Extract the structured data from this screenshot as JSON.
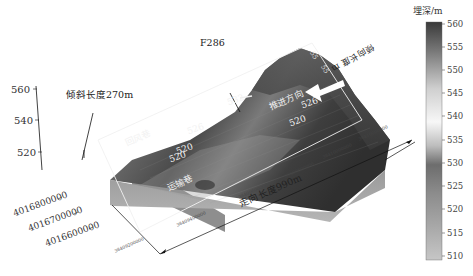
{
  "figure": {
    "type": "3d-terrain-surface",
    "annotations": {
      "fault": "F286",
      "dip_length": "倾斜长度270m",
      "strike_length": "走向长度990m",
      "advance_direction": "推进方向",
      "return_airway": "回风巷",
      "haulage_roadway": "运输巷",
      "rotated_label": "倾向长度 m"
    },
    "terrain_labels": [
      "532",
      "526",
      "526",
      "520",
      "520",
      "520",
      "55",
      "55"
    ],
    "z_axis": {
      "ticks": [
        "560",
        "540",
        "520"
      ]
    },
    "y_axis": {
      "ticks": [
        "4016800000",
        "4016700000",
        "4016600000"
      ]
    },
    "x_axis": {
      "ticks": [
        "38409200000",
        "38409400000",
        "38409600000",
        "38409800000",
        "38410000000",
        "38410000000"
      ]
    },
    "colorbar": {
      "title": "埋深/m",
      "ticks": [
        "560",
        "555",
        "550",
        "545",
        "540",
        "535",
        "530",
        "525",
        "520",
        "515",
        "510"
      ],
      "colors": {
        "560": "#3a3a3a",
        "545": "#e8e8e8",
        "538": "#f5f5f5",
        "530": "#707070",
        "510": "#bdbdbd"
      }
    }
  }
}
